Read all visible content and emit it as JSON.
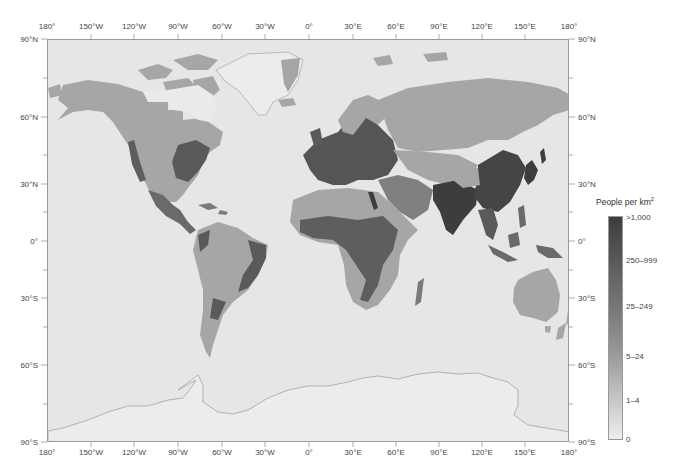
{
  "map": {
    "title": "World population density",
    "projection_extent": {
      "lon": [
        -180,
        180
      ],
      "lat": [
        -90,
        90
      ]
    },
    "colors": {
      "ocean": "#e6e6e6",
      "uninhabited": "#eeeeee",
      "low": "#c6c6c6",
      "medium": "#a6a6a6",
      "high": "#6e6e6e",
      "very_high": "#3d3d3d",
      "frame": "#9a9a9a"
    },
    "x_ticks_top": [
      {
        "label": "180°",
        "x": 47
      },
      {
        "label": "150°W",
        "x": 91
      },
      {
        "label": "120°W",
        "x": 134
      },
      {
        "label": "90°W",
        "x": 178
      },
      {
        "label": "60°W",
        "x": 222
      },
      {
        "label": "30°W",
        "x": 265
      },
      {
        "label": "0°",
        "x": 309
      },
      {
        "label": "30°E",
        "x": 353
      },
      {
        "label": "60°E",
        "x": 396
      },
      {
        "label": "90°E",
        "x": 439
      },
      {
        "label": "120°E",
        "x": 482
      },
      {
        "label": "150°E",
        "x": 525
      },
      {
        "label": "180°",
        "x": 569
      }
    ],
    "y_ticks": [
      {
        "label": "90°N",
        "y": 39
      },
      {
        "label": "60°N",
        "y": 117
      },
      {
        "label": "30°N",
        "y": 184
      },
      {
        "label": "0°",
        "y": 241
      },
      {
        "label": "30°S",
        "y": 298
      },
      {
        "label": "60°S",
        "y": 365
      },
      {
        "label": "90°S",
        "y": 442
      }
    ]
  },
  "legend": {
    "title": "People per km",
    "title_superscript": "2",
    "entries": [
      {
        "label": ">1,000",
        "y": 217
      },
      {
        "label": "250–999",
        "y": 260
      },
      {
        "label": "25–249",
        "y": 306
      },
      {
        "label": "5–24",
        "y": 356
      },
      {
        "label": "1–4",
        "y": 400
      },
      {
        "label": "0",
        "y": 439
      }
    ]
  }
}
